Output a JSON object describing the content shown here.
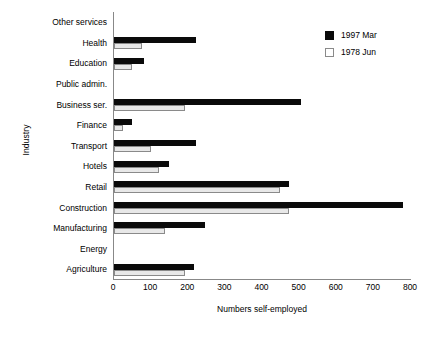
{
  "chart_data": {
    "type": "bar",
    "orientation": "horizontal",
    "title": "",
    "xlabel": "Numbers self-employed",
    "ylabel": "Industry",
    "xlim": [
      0,
      800
    ],
    "xticks": [
      0,
      100,
      200,
      300,
      400,
      500,
      600,
      700,
      800
    ],
    "grid": false,
    "legend_position": "top-right",
    "categories": [
      "Other services",
      "Health",
      "Education",
      "Public admin.",
      "Business ser.",
      "Finance",
      "Transport",
      "Hotels",
      "Retail",
      "Construction",
      "Manufacturing",
      "Energy",
      "Agriculture"
    ],
    "series": [
      {
        "name": "1997 Mar",
        "color": "#0a0a0a",
        "values": [
          0,
          221,
          81,
          0,
          504,
          48,
          221,
          149,
          472,
          778,
          246,
          0,
          216
        ]
      },
      {
        "name": "1978 Jun",
        "color": "#e8e8e8",
        "values": [
          0,
          75,
          48,
          0,
          191,
          25,
          100,
          121,
          448,
          472,
          138,
          0,
          191
        ]
      }
    ]
  }
}
